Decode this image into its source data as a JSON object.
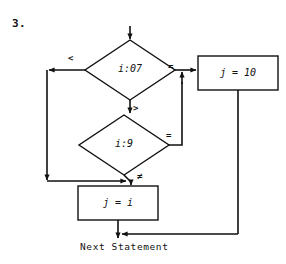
{
  "page": {
    "item_number": "3.",
    "caption": "Next Statement",
    "background_color": "#ffffff",
    "line_color": "#111111"
  },
  "flowchart": {
    "type": "flowchart",
    "nodes": [
      {
        "id": "decision-i-07",
        "shape": "diamond",
        "text": "i:07",
        "center": [
          130,
          70
        ],
        "width": 90,
        "height": 60
      },
      {
        "id": "decision-i-9",
        "shape": "diamond",
        "text": "i:9",
        "center": [
          124,
          145
        ],
        "width": 90,
        "height": 60
      },
      {
        "id": "process-j-10",
        "shape": "rectangle",
        "text": "j = 10",
        "x": 198,
        "y": 56,
        "width": 80,
        "height": 34
      },
      {
        "id": "process-j-i",
        "shape": "rectangle",
        "text": "j = i",
        "x": 78,
        "y": 186,
        "width": 80,
        "height": 34
      }
    ],
    "edges": [
      {
        "id": "entry-arrow",
        "from": "start",
        "to": "decision-i-07",
        "label": ""
      },
      {
        "id": "edge-lt",
        "from": "decision-i-07",
        "to": "junction-bottom",
        "label": "<"
      },
      {
        "id": "edge-eq-1",
        "from": "decision-i-07",
        "to": "process-j-10",
        "label": "="
      },
      {
        "id": "edge-gt",
        "from": "decision-i-07",
        "to": "decision-i-9",
        "label": ">"
      },
      {
        "id": "edge-eq-2",
        "from": "decision-i-9",
        "to": "process-j-10",
        "label": "="
      },
      {
        "id": "edge-neq",
        "from": "decision-i-9",
        "to": "process-j-i",
        "label": "≠"
      },
      {
        "id": "edge-j10-exit",
        "from": "process-j-10",
        "to": "next-statement",
        "label": ""
      },
      {
        "id": "edge-ji-exit",
        "from": "process-j-i",
        "to": "next-statement",
        "label": ""
      }
    ],
    "labels": {
      "less_than": "<",
      "equal_first": "=",
      "greater_than": ">",
      "equal_second": "=",
      "not_equal": "≠"
    }
  }
}
